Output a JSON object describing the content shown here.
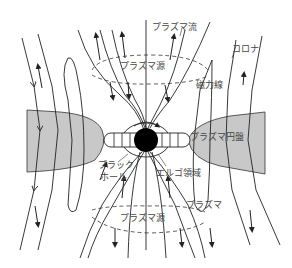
{
  "diagram": {
    "labels": {
      "plasma_flow": "プラズマ流",
      "corona": "コロナ",
      "plasma_source_top": "プラズマ源",
      "magnetic_field_line": "磁力線",
      "plasma_disk": "プラズマ円盤",
      "black_hole_line1": "ブラック",
      "black_hole_line2": "ホール",
      "ergo_region": "エルゴ領域",
      "plasma": "プラズマ",
      "plasma_source_bottom": "プラズマ源"
    },
    "colors": {
      "disk": "#c8c8c8",
      "line": "#222222",
      "black_hole": "#000000",
      "text": "#444444"
    }
  }
}
